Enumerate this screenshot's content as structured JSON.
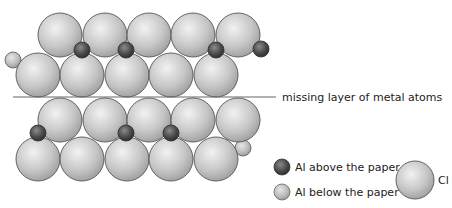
{
  "diagram": {
    "colors": {
      "cl_fill_light": "#eeeeee",
      "cl_fill_dark": "#a8a8a8",
      "cl_stroke": "#555555",
      "al_above_light": "#8a8a8a",
      "al_above_dark": "#2e2e2e",
      "al_below_light": "#e2e2e2",
      "al_below_dark": "#9a9a9a",
      "line": "#666666"
    },
    "cl_radius": 22,
    "al_radius": 8,
    "top_layer": {
      "cl_back_row": [
        [
          60,
          35
        ],
        [
          105,
          35
        ],
        [
          149,
          35
        ],
        [
          193,
          35
        ],
        [
          238,
          35
        ]
      ],
      "cl_front_row": [
        [
          38,
          75
        ],
        [
          82,
          75
        ],
        [
          127,
          75
        ],
        [
          171,
          75
        ],
        [
          216,
          75
        ]
      ],
      "al_above": [
        [
          82,
          50
        ],
        [
          126,
          50
        ],
        [
          216,
          50
        ],
        [
          261,
          49
        ]
      ],
      "al_below": [
        [
          13,
          60
        ]
      ]
    },
    "bottom_layer": {
      "cl_back_row": [
        [
          60,
          120
        ],
        [
          105,
          120
        ],
        [
          149,
          120
        ],
        [
          193,
          120
        ],
        [
          238,
          120
        ]
      ],
      "cl_front_row": [
        [
          38,
          159
        ],
        [
          82,
          159
        ],
        [
          127,
          159
        ],
        [
          171,
          159
        ],
        [
          216,
          159
        ]
      ],
      "al_above": [
        [
          38,
          133
        ],
        [
          126,
          133
        ],
        [
          171,
          133
        ]
      ],
      "al_below": [
        [
          243,
          148
        ]
      ]
    },
    "gap_line": {
      "x1": 13,
      "x2": 276,
      "y": 97
    },
    "gap_label": "missing layer of metal atoms"
  },
  "legend": {
    "al_above_label": "Al above the paper",
    "al_below_label": "Al below the paper",
    "cl_label": "Cl"
  }
}
